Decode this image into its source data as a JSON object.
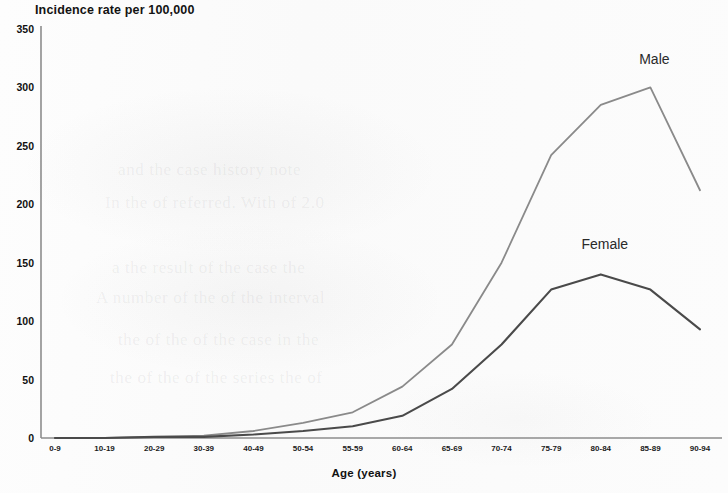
{
  "chart_data": {
    "type": "line",
    "title": "Incidence rate per 100,000",
    "xlabel": "Age (years)",
    "ylabel": "",
    "ylim": [
      0,
      350
    ],
    "yticks": [
      0,
      50,
      100,
      150,
      200,
      250,
      300,
      350
    ],
    "grid": false,
    "legend_position": "inline-annotation",
    "categories": [
      "0-9",
      "10-19",
      "20-29",
      "30-39",
      "40-49",
      "50-54",
      "55-59",
      "60-64",
      "65-69",
      "70-74",
      "75-79",
      "80-84",
      "85-89",
      "90-94"
    ],
    "series": [
      {
        "name": "Male",
        "color": "#8a8a8a",
        "values": [
          0,
          0,
          1,
          2,
          6,
          13,
          22,
          44,
          80,
          150,
          242,
          285,
          300,
          212
        ]
      },
      {
        "name": "Female",
        "color": "#4a4a4a",
        "values": [
          0,
          0,
          1,
          1,
          3,
          6,
          10,
          19,
          42,
          80,
          127,
          140,
          127,
          93
        ]
      }
    ],
    "annotations": [
      {
        "text": "Male",
        "category": "85-89",
        "value": 300
      },
      {
        "text": "Female",
        "category": "80-84",
        "value": 140
      }
    ]
  },
  "axis": {
    "y_tick_labels": [
      "350",
      "300",
      "250",
      "200",
      "150",
      "100",
      "50",
      "0"
    ],
    "x_tick_labels": [
      "0-9",
      "10-19",
      "20-29",
      "30-39",
      "40-49",
      "50-54",
      "55-59",
      "60-64",
      "65-69",
      "70-74",
      "75-79",
      "80-84",
      "85-89",
      "90-94"
    ]
  },
  "ghost_text": {
    "line1": "and the case history note",
    "line2": "In the of referred. With of 2.0",
    "line3": "a the result of the case the",
    "line4": "A number of the of the interval",
    "line5": "the of the of the case in the",
    "line6": "the of the of the series the of"
  }
}
